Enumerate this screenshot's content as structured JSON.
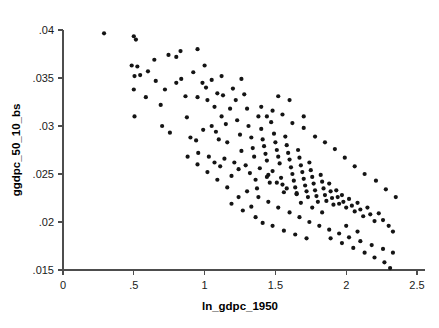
{
  "chart_data": {
    "type": "scatter",
    "title": "",
    "xlabel": "ln_gdpc_1950",
    "ylabel": "ggdpc_50_10_bs",
    "xlim": [
      0,
      2.5
    ],
    "ylim": [
      0.015,
      0.04
    ],
    "xticks": [
      0,
      0.5,
      1,
      1.5,
      2,
      2.5
    ],
    "xtick_labels": [
      "0",
      ".5",
      "1",
      "1.5",
      "2",
      "2.5"
    ],
    "yticks": [
      0.015,
      0.02,
      0.025,
      0.03,
      0.035,
      0.04
    ],
    "ytick_labels": [
      ".015",
      ".02",
      ".025",
      ".03",
      ".035",
      ".04"
    ],
    "grid": false,
    "legend": false,
    "marker": {
      "shape": "circle",
      "color": "#141414",
      "size_px": 4.2
    },
    "series": [
      {
        "name": "countries",
        "n_points": 196,
        "points": [
          [
            0.29,
            0.03965
          ],
          [
            0.5,
            0.03935
          ],
          [
            0.515,
            0.039
          ],
          [
            0.485,
            0.0363
          ],
          [
            0.525,
            0.0362
          ],
          [
            0.505,
            0.0352
          ],
          [
            0.545,
            0.0353
          ],
          [
            0.5,
            0.0338
          ],
          [
            0.505,
            0.031
          ],
          [
            0.6,
            0.0357
          ],
          [
            0.645,
            0.0369
          ],
          [
            0.655,
            0.0347
          ],
          [
            0.585,
            0.033
          ],
          [
            0.69,
            0.0322
          ],
          [
            0.72,
            0.0338
          ],
          [
            0.745,
            0.0374
          ],
          [
            0.8,
            0.0372
          ],
          [
            0.83,
            0.0378
          ],
          [
            0.835,
            0.0349
          ],
          [
            0.7,
            0.03
          ],
          [
            0.755,
            0.0293
          ],
          [
            0.8,
            0.0345
          ],
          [
            0.865,
            0.0331
          ],
          [
            0.875,
            0.0309
          ],
          [
            0.92,
            0.0356
          ],
          [
            0.95,
            0.038
          ],
          [
            0.985,
            0.0345
          ],
          [
            0.95,
            0.033
          ],
          [
            1.0,
            0.0363
          ],
          [
            1.01,
            0.034
          ],
          [
            1.02,
            0.0327
          ],
          [
            0.9,
            0.0288
          ],
          [
            0.94,
            0.0285
          ],
          [
            0.99,
            0.0296
          ],
          [
            0.955,
            0.0272
          ],
          [
            1.05,
            0.0348
          ],
          [
            1.07,
            0.032
          ],
          [
            1.09,
            0.0334
          ],
          [
            1.12,
            0.0352
          ],
          [
            1.13,
            0.0332
          ],
          [
            1.05,
            0.03
          ],
          [
            1.08,
            0.0294
          ],
          [
            1.1,
            0.0286
          ],
          [
            1.15,
            0.0302
          ],
          [
            1.16,
            0.0283
          ],
          [
            1.03,
            0.0268
          ],
          [
            1.07,
            0.0262
          ],
          [
            1.11,
            0.0258
          ],
          [
            1.14,
            0.0266
          ],
          [
            1.18,
            0.0318
          ],
          [
            1.2,
            0.0339
          ],
          [
            1.22,
            0.0327
          ],
          [
            1.23,
            0.0306
          ],
          [
            1.25,
            0.0291
          ],
          [
            1.26,
            0.0274
          ],
          [
            1.21,
            0.0262
          ],
          [
            1.24,
            0.0255
          ],
          [
            1.19,
            0.0248
          ],
          [
            1.28,
            0.0333
          ],
          [
            1.3,
            0.0318
          ],
          [
            1.31,
            0.03
          ],
          [
            1.33,
            0.0288
          ],
          [
            1.34,
            0.0277
          ],
          [
            1.35,
            0.0268
          ],
          [
            1.29,
            0.0259
          ],
          [
            1.32,
            0.0251
          ],
          [
            1.36,
            0.0244
          ],
          [
            1.38,
            0.031
          ],
          [
            1.4,
            0.0297
          ],
          [
            1.41,
            0.0286
          ],
          [
            1.42,
            0.0279
          ],
          [
            1.43,
            0.0271
          ],
          [
            1.44,
            0.0264
          ],
          [
            1.39,
            0.0256
          ],
          [
            1.45,
            0.0249
          ],
          [
            1.46,
            0.0241
          ],
          [
            1.37,
            0.0235
          ],
          [
            1.47,
            0.0304
          ],
          [
            1.49,
            0.0292
          ],
          [
            1.5,
            0.0283
          ],
          [
            1.51,
            0.0275
          ],
          [
            1.52,
            0.0268
          ],
          [
            1.53,
            0.0261
          ],
          [
            1.48,
            0.0253
          ],
          [
            1.54,
            0.0246
          ],
          [
            1.55,
            0.0239
          ],
          [
            1.56,
            0.0231
          ],
          [
            1.57,
            0.0289
          ],
          [
            1.58,
            0.028
          ],
          [
            1.59,
            0.0272
          ],
          [
            1.6,
            0.0265
          ],
          [
            1.61,
            0.0257
          ],
          [
            1.62,
            0.025
          ],
          [
            1.63,
            0.0243
          ],
          [
            1.64,
            0.0236
          ],
          [
            1.65,
            0.0229
          ],
          [
            1.66,
            0.0275
          ],
          [
            1.67,
            0.0267
          ],
          [
            1.68,
            0.0259
          ],
          [
            1.69,
            0.0252
          ],
          [
            1.7,
            0.0245
          ],
          [
            1.71,
            0.0238
          ],
          [
            1.72,
            0.0232
          ],
          [
            1.73,
            0.0226
          ],
          [
            1.74,
            0.0262
          ],
          [
            1.75,
            0.0254
          ],
          [
            1.76,
            0.0247
          ],
          [
            1.77,
            0.024
          ],
          [
            1.78,
            0.0233
          ],
          [
            1.79,
            0.0227
          ],
          [
            1.8,
            0.0221
          ],
          [
            1.82,
            0.0249
          ],
          [
            1.83,
            0.0242
          ],
          [
            1.84,
            0.0235
          ],
          [
            1.85,
            0.0228
          ],
          [
            1.86,
            0.0222
          ],
          [
            1.88,
            0.024
          ],
          [
            1.89,
            0.0232
          ],
          [
            1.9,
            0.0225
          ],
          [
            1.91,
            0.0218
          ],
          [
            1.93,
            0.0233
          ],
          [
            1.94,
            0.0226
          ],
          [
            1.95,
            0.0219
          ],
          [
            1.97,
            0.0228
          ],
          [
            1.98,
            0.0221
          ],
          [
            2.0,
            0.0215
          ],
          [
            2.02,
            0.0224
          ],
          [
            2.04,
            0.0217
          ],
          [
            2.06,
            0.0211
          ],
          [
            2.08,
            0.022
          ],
          [
            2.1,
            0.0213
          ],
          [
            2.12,
            0.0206
          ],
          [
            2.15,
            0.0215
          ],
          [
            2.17,
            0.0208
          ],
          [
            2.2,
            0.0201
          ],
          [
            2.23,
            0.0209
          ],
          [
            2.26,
            0.0202
          ],
          [
            2.3,
            0.0196
          ],
          [
            2.33,
            0.019
          ],
          [
            1.4,
            0.032
          ],
          [
            1.48,
            0.0316
          ],
          [
            1.55,
            0.0312
          ],
          [
            1.62,
            0.0303
          ],
          [
            1.7,
            0.0298
          ],
          [
            1.78,
            0.0289
          ],
          [
            1.85,
            0.0283
          ],
          [
            1.92,
            0.0276
          ],
          [
            1.99,
            0.0267
          ],
          [
            2.06,
            0.0258
          ],
          [
            2.13,
            0.025
          ],
          [
            2.21,
            0.0243
          ],
          [
            2.28,
            0.0234
          ],
          [
            2.35,
            0.0226
          ],
          [
            1.3,
            0.0232
          ],
          [
            1.38,
            0.0226
          ],
          [
            1.45,
            0.0221
          ],
          [
            1.52,
            0.0215
          ],
          [
            1.6,
            0.021
          ],
          [
            1.67,
            0.0205
          ],
          [
            1.74,
            0.02
          ],
          [
            1.81,
            0.0196
          ],
          [
            1.88,
            0.0192
          ],
          [
            1.95,
            0.0188
          ],
          [
            2.02,
            0.0184
          ],
          [
            2.1,
            0.018
          ],
          [
            2.18,
            0.0176
          ],
          [
            2.26,
            0.0172
          ],
          [
            2.33,
            0.0168
          ],
          [
            2.2,
            0.0163
          ],
          [
            2.27,
            0.0158
          ],
          [
            2.31,
            0.0152
          ],
          [
            2.13,
            0.0168
          ],
          [
            2.05,
            0.0173
          ],
          [
            1.97,
            0.0178
          ],
          [
            1.89,
            0.0183
          ],
          [
            1.56,
            0.0191
          ],
          [
            1.48,
            0.0196
          ],
          [
            1.64,
            0.0187
          ],
          [
            1.72,
            0.0183
          ],
          [
            1.36,
            0.0205
          ],
          [
            1.27,
            0.0212
          ],
          [
            1.19,
            0.0219
          ],
          [
            1.41,
            0.0199
          ],
          [
            1.33,
            0.0216
          ],
          [
            1.24,
            0.0226
          ],
          [
            1.16,
            0.0236
          ],
          [
            1.09,
            0.0244
          ],
          [
            1.02,
            0.0252
          ],
          [
            0.95,
            0.026
          ],
          [
            0.88,
            0.0268
          ],
          [
            1.44,
            0.0247
          ],
          [
            1.51,
            0.0241
          ],
          [
            1.58,
            0.0235
          ],
          [
            1.65,
            0.023
          ],
          [
            2.0,
            0.0196
          ],
          [
            2.08,
            0.019
          ],
          [
            1.83,
            0.021
          ],
          [
            1.76,
            0.0215
          ],
          [
            1.68,
            0.022
          ],
          [
            1.12,
            0.031
          ],
          [
            1.26,
            0.0349
          ],
          [
            1.44,
            0.031
          ],
          [
            1.7,
            0.031
          ],
          [
            1.6,
            0.0327
          ],
          [
            1.52,
            0.0331
          ]
        ]
      }
    ]
  }
}
